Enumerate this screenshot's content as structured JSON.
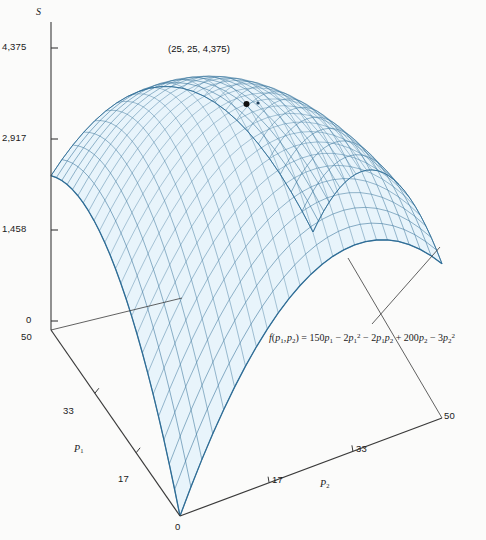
{
  "figure": {
    "type": "3d-surface-wireframe",
    "background": "#fbfbfa",
    "mesh_line_color": "#2f6d96",
    "mesh_fill_color": "#e8f4fb",
    "axis_color": "#3a3a3a"
  },
  "axes": {
    "vertical": {
      "label": "S",
      "ticks": [
        "4,375",
        "2,917",
        "1,458",
        "0"
      ],
      "tick_values": [
        4375,
        2917,
        1458,
        0
      ],
      "max": 4375
    },
    "left": {
      "label": "P",
      "label_sub": "1",
      "ticks": [
        "50",
        "33",
        "17",
        "0"
      ],
      "tick_values": [
        50,
        33,
        17,
        0
      ],
      "max": 50
    },
    "right": {
      "label": "P",
      "label_sub": "2",
      "ticks": [
        "0",
        "17",
        "33",
        "50"
      ],
      "tick_values": [
        0,
        17,
        33,
        50
      ],
      "max": 50
    }
  },
  "annotations": {
    "max_point": "(25, 25, 4,375)",
    "max_point_values": [
      25,
      25,
      4375
    ],
    "formula_plain": "f(p1, p2) = 150p1 - 2p1^2 - 2p1p2 + 200p2 - 3p2^2"
  },
  "chart_data": {
    "type": "surface",
    "title": "",
    "xlabel": "P1",
    "ylabel": "P2",
    "zlabel": "S",
    "function": "f(p1,p2) = 150*p1 - 2*p1^2 - 2*p1*p2 + 200*p2 - 3*p2^2",
    "xlim": [
      0,
      50
    ],
    "ylim": [
      0,
      50
    ],
    "zlim": [
      0,
      4375
    ],
    "grid": false,
    "legend": "none",
    "maximum": {
      "p1": 25,
      "p2": 25,
      "S": 4375
    },
    "z_ticks": [
      0,
      1458,
      2917,
      4375
    ],
    "x_ticks": [
      0,
      17,
      33,
      50
    ],
    "y_ticks": [
      0,
      17,
      33,
      50
    ],
    "mesh_divisions": 24,
    "corner_values": [
      {
        "p1": 0,
        "p2": 0,
        "S": 0
      },
      {
        "p1": 50,
        "p2": 0,
        "S": 2500
      },
      {
        "p1": 0,
        "p2": 50,
        "S": 2500
      },
      {
        "p1": 50,
        "p2": 50,
        "S": 0
      }
    ],
    "sample_grid": {
      "p1": [
        0,
        12.5,
        25,
        37.5,
        50
      ],
      "p2": [
        0,
        12.5,
        25,
        37.5,
        50
      ],
      "S": [
        [
          0,
          2031,
          3125,
          3281,
          2500
        ],
        [
          1562,
          3281,
          4062,
          3906,
          2812
        ],
        [
          2500,
          3906,
          4375,
          3906,
          2500
        ],
        [
          2812,
          3906,
          4062,
          3281,
          1562
        ],
        [
          2500,
          3281,
          3125,
          2031,
          0
        ]
      ]
    }
  }
}
